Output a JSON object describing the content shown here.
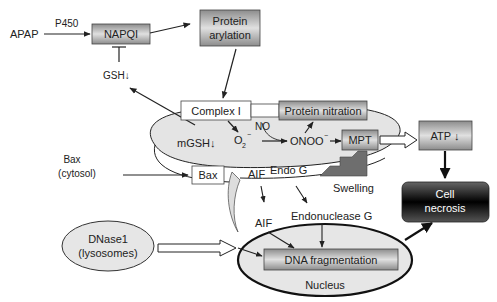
{
  "diagram": {
    "nodes": {
      "apap": "APAP",
      "p450": "P450",
      "napqi": "NAPQI",
      "gsh": "GSH↓",
      "protein_arylation_1": "Protein",
      "protein_arylation_2": "arylation",
      "complex1": "Complex I",
      "protein_nitration": "Protein nitration",
      "no": "NO",
      "mgsh": "mGSH↓",
      "o2": "O",
      "o2_sub": "2",
      "o2_sup": "−",
      "onoo": "ONOO",
      "onoo_sup": "−",
      "mpt": "MPT",
      "atp": "ATP ↓",
      "bax_cytosol_1": "Bax",
      "bax_cytosol_2": "(cytosol)",
      "bax": "Bax",
      "aif_mito": "AIF",
      "endo_g_mito": "Endo G",
      "swelling": "Swelling",
      "cell_necrosis_1": "Cell",
      "cell_necrosis_2": "necrosis",
      "aif": "AIF",
      "endonuclease_g": "Endonuclease G",
      "dnase1_1": "DNase1",
      "dnase1_2": "(lysosomes)",
      "dna_fragmentation": "DNA fragmentation",
      "nucleus": "Nucleus"
    },
    "colors": {
      "box_gray": "#b8b8b8",
      "mito_fill": "#e6e6e6",
      "necrosis_dark": "#1a1a1a",
      "swelling_arrow": "#707070"
    }
  }
}
